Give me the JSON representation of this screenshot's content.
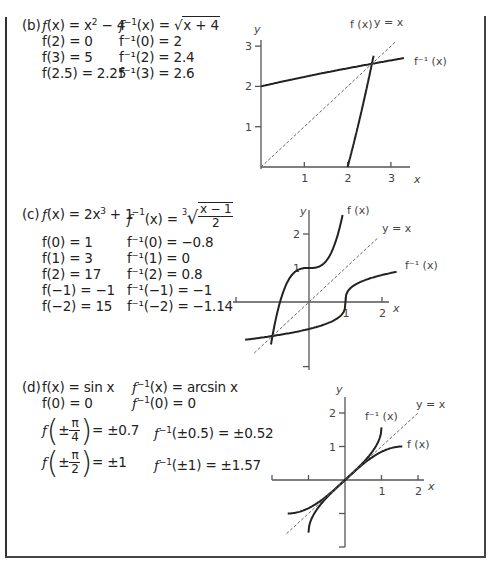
{
  "parts": [
    {
      "id": "b",
      "label": "(b)",
      "f_def": "f(x) = x² − 4",
      "finv_def": "f⁻¹(x) = √(x + 4)",
      "f_values": [
        "f(2) = 0",
        "f(3) = 5",
        "f(2.5) = 2.25"
      ],
      "finv_values": [
        "f⁻¹(0) = 2",
        "f⁻¹(2) = 2.4",
        "f⁻¹(3) = 2.6"
      ]
    },
    {
      "id": "c",
      "label": "(c)",
      "f_def": "f(x) = 2x³ + 1",
      "finv_def": "f⁻¹(x) = ∛((x − 1)/2)",
      "f_values": [
        "f(0) = 1",
        "f(1) = 3",
        "f(2) = 17",
        "f(−1) = −1",
        "f(−2) = 15"
      ],
      "finv_values": [
        "f⁻¹(0) = −0.8",
        "f⁻¹(1) = 0",
        "f⁻¹(2) = 0.8",
        "f⁻¹(−1) = −1",
        "f⁻¹(−2) = −1.14"
      ]
    },
    {
      "id": "d",
      "label": "(d)",
      "f_def": "f(x) = sin x",
      "finv_def": "f⁻¹(x) = arcsin x",
      "f_values": [
        "f(0) = 0",
        "f(±π/4) = ±0.7",
        "f(±π/2) = ±1"
      ],
      "finv_values": [
        "f⁻¹(0) = 0",
        "f⁻¹(±0.5) = ±0.52",
        "f⁻¹(±1) = ±1.57"
      ]
    }
  ],
  "text": {
    "b_label": "(b)",
    "b_fx": "f",
    "b_fx_rest": "(x) = x",
    "b_fx_exp": "2",
    "b_fx_tail": " − 4",
    "b_finv": "f",
    "b_finv_sup": "−1",
    "b_finv_rest": "(x) = ",
    "b_finv_root": "x + 4",
    "c_label": "(c)",
    "c_fx": "f",
    "c_fx_rest": "(x) = 2x",
    "c_fx_exp": "3",
    "c_fx_tail": " + 1",
    "c_finv": "f",
    "c_finv_sup": "−1",
    "c_finv_rest": "(x) = ",
    "c_root_index": "3",
    "c_frac_num": "x − 1",
    "c_frac_den": "2",
    "d_label": "(d)",
    "d_fx": "f(x) = sin x",
    "d_finv": "f",
    "d_finv_sup": "−1",
    "d_finv_rest": "(x) = arcsin x",
    "d_f0": "f(0) = 0",
    "d_finv0": "0",
    "d_fpi4_pre": "f",
    "d_fpi4_pm": "±",
    "d_pi": "π",
    "d_four": "4",
    "d_fpi4_val": "= ±0.7",
    "d_finv05": "(±0.5) = ±0.52",
    "d_fpi2_pre": "f",
    "d_fpi2_pm": "±",
    "d_two": "2",
    "d_fpi2_val": "= ±1",
    "d_finv1": "(±1) = ±1.57",
    "inv_f": "f",
    "inv_sup": "−1"
  },
  "chart_data": [
    {
      "type": "line",
      "title": "(b)",
      "xlabel": "x",
      "ylabel": "y",
      "xlim": [
        0,
        3.4
      ],
      "ylim": [
        0,
        3.1
      ],
      "xticks": [
        "1",
        "2",
        "3"
      ],
      "yticks": [
        "1",
        "2",
        "3"
      ],
      "series": [
        {
          "name": "f(x)",
          "label": "f (x)",
          "expr": "x^2 - 4",
          "domain": [
            2,
            2.6
          ]
        },
        {
          "name": "f^-1(x)",
          "label": "f⁻¹ (x)",
          "expr": "sqrt(x + 4)",
          "domain": [
            0,
            3.3
          ]
        },
        {
          "name": "y = x",
          "label": "y = x",
          "style": "dashed",
          "domain": [
            0,
            3.1
          ]
        }
      ]
    },
    {
      "type": "line",
      "title": "(c)",
      "xlabel": "x",
      "ylabel": "y",
      "xlim": [
        -2,
        2.1
      ],
      "ylim": [
        -1.7,
        2.5
      ],
      "xticks": [
        "1",
        "2"
      ],
      "yticks": [
        "1",
        "2"
      ],
      "series": [
        {
          "name": "f(x)",
          "label": "f (x)",
          "expr": "2x^3 + 1",
          "domain": [
            -1.04,
            0.92
          ]
        },
        {
          "name": "f^-1(x)",
          "label": "f⁻¹ (x)",
          "expr": "cbrt((x - 1)/2)",
          "domain": [
            -1.75,
            2.4
          ]
        },
        {
          "name": "y = x",
          "label": "y = x",
          "style": "dashed",
          "domain": [
            -1.5,
            1.9
          ]
        }
      ]
    },
    {
      "type": "line",
      "title": "(d)",
      "xlabel": "x",
      "ylabel": "y",
      "xlim": [
        -2,
        2.1
      ],
      "ylim": [
        -2,
        2.3
      ],
      "xticks": [
        "1",
        "2"
      ],
      "yticks": [
        "1",
        "2"
      ],
      "series": [
        {
          "name": "f(x)",
          "label": "f (x)",
          "expr": "sin x",
          "domain": [
            -1.5708,
            1.5708
          ]
        },
        {
          "name": "f^-1(x)",
          "label": "f⁻¹ (x)",
          "expr": "arcsin x",
          "domain": [
            -1,
            1
          ]
        },
        {
          "name": "y = x",
          "label": "y = x",
          "style": "dashed",
          "domain": [
            -1.6,
            2.0
          ]
        }
      ]
    }
  ]
}
